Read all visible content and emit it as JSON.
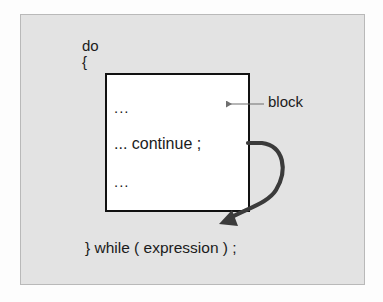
{
  "figure": {
    "panel_background": "#e3e3e3",
    "panel_border": "#b9b9b9",
    "page_background": "#fdfdfd",
    "ink_color": "#1b1b1b"
  },
  "code": {
    "keyword_do": "do",
    "brace_open": "{",
    "while_line": "} while ( expression ) ;"
  },
  "block": {
    "line_1": "...",
    "line_2": "... continue ;",
    "line_3": "...",
    "border_color": "#111111",
    "fill_color": "#ffffff"
  },
  "callout": {
    "label": "block",
    "leader_color": "#6f6f6f"
  },
  "flow_arrow": {
    "name": "continue-jump-arrow",
    "color": "#3b3b3b",
    "from": "... continue ;",
    "to": "} while ( expression ) ;"
  }
}
